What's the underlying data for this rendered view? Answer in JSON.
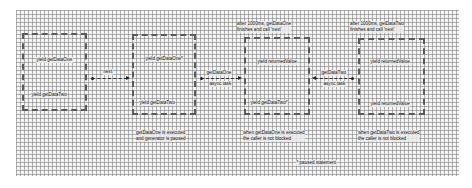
{
  "diagram": {
    "boxes": [
      {
        "id": "box1",
        "top_label": "yield getDataOne",
        "bottom_label": "yield getDataTwo",
        "caption_above": "",
        "caption_below": ""
      },
      {
        "id": "box2",
        "top_label": "yield getDataOne*",
        "bottom_label": "yield getDataTwo",
        "caption_above": "",
        "caption_below": "getDataOne is executed\nand generator is paused"
      },
      {
        "id": "box3",
        "top_label": "yield returnedValue",
        "bottom_label": "yield getDataTwo*",
        "caption_above": "after 1000ms, getDataOne\nfinishes and call 'next'",
        "caption_below": "when getDataOne is executed\nthe caller is not blocked"
      },
      {
        "id": "box4",
        "top_label": "yield returnedValue",
        "bottom_label": "yield returnedValue",
        "caption_above": "after 1000ms, getDataTwo\nfinishes and call 'next'",
        "caption_below": "when getDataTwo is executed\nthe caller is not blocked"
      }
    ],
    "arrows": [
      {
        "id": "next",
        "label_above": "next",
        "label_below": "",
        "direction": "right"
      },
      {
        "id": "getDataOne",
        "label_above": "getDataOne",
        "label_below": "async task",
        "direction": "right"
      },
      {
        "id": "getDataTwo",
        "label_above": "getDataTwo",
        "label_below": "async task",
        "direction": "left"
      }
    ],
    "footnote": "* paused statement",
    "colors": {
      "grid_line": "#787878",
      "background": "#f4f4f4",
      "border": "#5a5a5a"
    }
  }
}
